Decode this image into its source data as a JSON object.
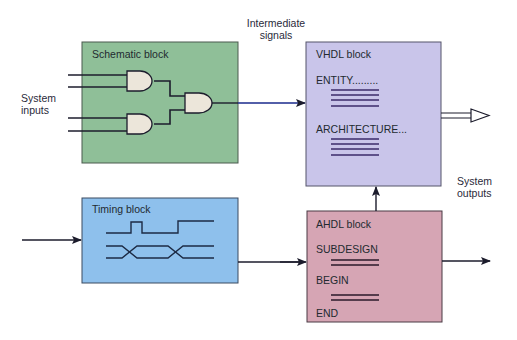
{
  "labels": {
    "intermediate_signals": [
      "Intermediate",
      "signals"
    ],
    "system_inputs": [
      "System",
      "inputs"
    ],
    "system_outputs": [
      "System",
      "outputs"
    ]
  },
  "blocks": {
    "schematic": {
      "title": "Schematic block",
      "color": "#8fbf98"
    },
    "vhdl": {
      "title": "VHDL block",
      "lines": [
        "ENTITY.........",
        "ARCHITECTURE..."
      ],
      "color": "#c9c5ea"
    },
    "timing": {
      "title": "Timing block",
      "color": "#8ec0ec"
    },
    "ahdl": {
      "title": "AHDL block",
      "lines": [
        "SUBDESIGN",
        "BEGIN",
        "END"
      ],
      "color": "#d6a5b4"
    }
  },
  "colors": {
    "stroke": "#1c1c2c",
    "blue_signal": "#1a2a8c",
    "gate_fill": "#ece6da",
    "border": "#4a4a55"
  }
}
